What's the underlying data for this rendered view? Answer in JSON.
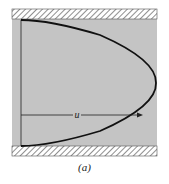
{
  "figure": {
    "caption": "(a)",
    "velocity_label": "u",
    "colors": {
      "fluid": "#c4c4c4",
      "wall_hatch": "#333333",
      "curve": "#111111"
    }
  }
}
